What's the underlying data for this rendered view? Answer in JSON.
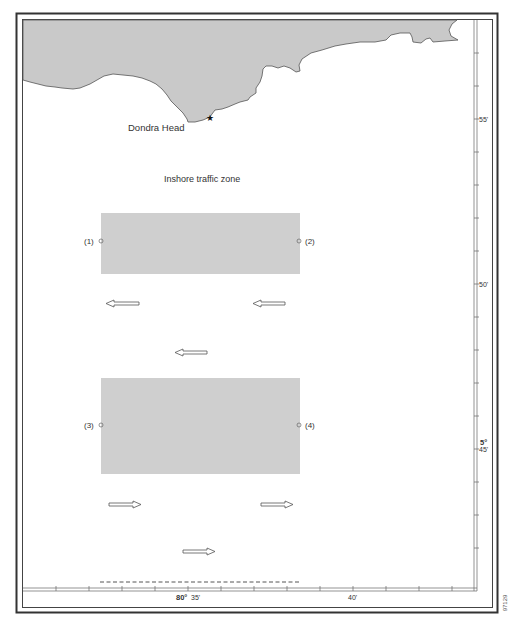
{
  "map": {
    "place_label": "Dondra Head",
    "zone_label": "Inshore traffic zone",
    "landmark_icon": "star-icon",
    "points": [
      {
        "label": "(1)"
      },
      {
        "label": "(2)"
      },
      {
        "label": "(3)"
      },
      {
        "label": "(4)"
      }
    ],
    "colors": {
      "land": "#c9c9c9",
      "separation_zone": "#cfcfcf",
      "outline": "#555555",
      "frame": "#333333"
    }
  },
  "scale": {
    "longitude": {
      "degree": "80°",
      "major_1": "35'",
      "major_2": "40'"
    },
    "latitude": {
      "label_55": "55'",
      "label_50": "50'",
      "degree": "5°",
      "label_45": "45'"
    }
  },
  "figure_code": "97129"
}
